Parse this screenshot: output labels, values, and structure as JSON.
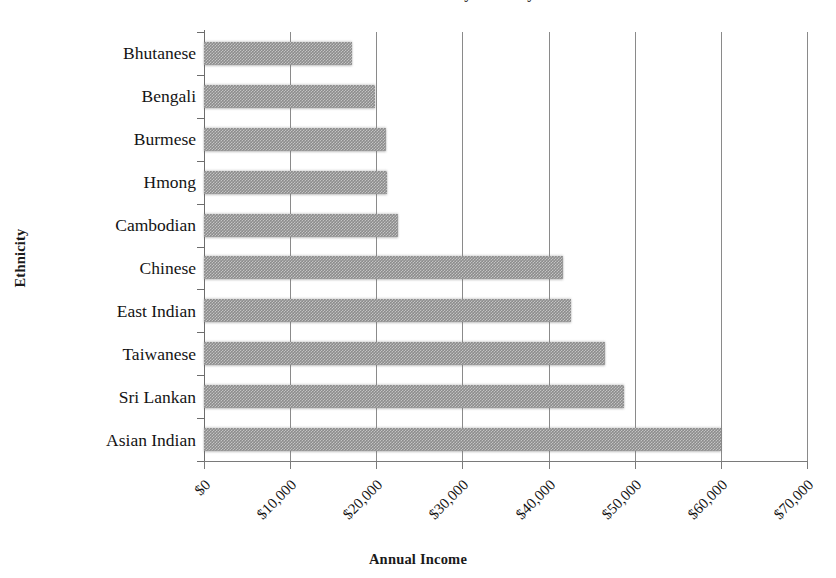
{
  "figure": {
    "title_remnant": "Median Annual Income by Ethnicity",
    "background_color": "#ffffff",
    "bar_color": "#8c8c8c",
    "gridline_color": "#8a8a8a",
    "axis_color": "#6d6d6d"
  },
  "axes": {
    "ylabel": "Ethnicity",
    "xlabel": "Annual Income"
  },
  "chart_data": {
    "type": "bar",
    "orientation": "horizontal",
    "title": "Median Annual Income by Ethnicity",
    "xlabel": "Annual Income",
    "ylabel": "Ethnicity",
    "categories": [
      "Bhutanese",
      "Bengali",
      "Burmese",
      "Hmong",
      "Cambodian",
      "Chinese",
      "East Indian",
      "Taiwanese",
      "Sri Lankan",
      "Asian Indian"
    ],
    "values": [
      17200,
      19800,
      21100,
      21300,
      22500,
      41700,
      42600,
      46500,
      48700,
      60000
    ],
    "xlim": [
      0,
      70000
    ],
    "xticks": [
      0,
      10000,
      20000,
      30000,
      40000,
      50000,
      60000,
      70000
    ],
    "xticklabels": [
      "$0",
      "$10,000",
      "$20,000",
      "$30,000",
      "$40,000",
      "$50,000",
      "$60,000",
      "$70,000"
    ],
    "xtick_rotation": -45,
    "grid": "vertical-only",
    "legend": null,
    "series": [
      {
        "name": "Annual Income",
        "values": [
          17200,
          19800,
          21100,
          21300,
          22500,
          41700,
          42600,
          46500,
          48700,
          60000
        ]
      }
    ]
  }
}
